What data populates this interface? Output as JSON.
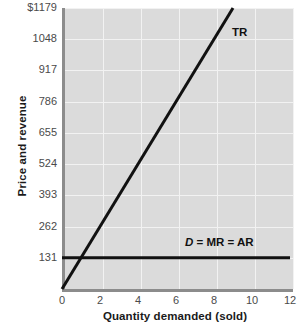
{
  "chart_data": {
    "type": "line",
    "title": "",
    "xlabel": "Quantity demanded (sold)",
    "ylabel": "Price and revenue",
    "xlim": [
      0,
      12
    ],
    "ylim": [
      0,
      1179
    ],
    "grid": true,
    "legend_position": "inline-annotation",
    "xticks": [
      "0",
      "2",
      "4",
      "6",
      "8",
      "10",
      "12"
    ],
    "xtick_values": [
      0,
      2,
      4,
      6,
      8,
      10,
      12
    ],
    "yticks": [
      "131",
      "262",
      "393",
      "524",
      "655",
      "786",
      "917",
      "1048",
      "$1179"
    ],
    "ytick_values": [
      131,
      262,
      393,
      524,
      655,
      786,
      917,
      1048,
      1179
    ],
    "series": [
      {
        "name": "TR",
        "label_html": "TR",
        "color": "#111111",
        "x": [
          0,
          9
        ],
        "values": [
          0,
          1179
        ],
        "note": "Total revenue line rising from origin through (9, 1179); slope = 131 per unit"
      },
      {
        "name": "D = MR = AR",
        "label_html": "<i>D</i> = MR = AR",
        "color": "#111111",
        "x": [
          0,
          12
        ],
        "values": [
          131,
          131
        ],
        "note": "Horizontal demand / marginal revenue / average revenue line at price 131"
      }
    ],
    "annotations": [
      {
        "text": "TR",
        "x": 9,
        "y": 1179
      },
      {
        "text": "D = MR = AR",
        "x": 7.2,
        "y": 220
      }
    ],
    "colors": {
      "plot_background": "#dbdbdb",
      "grid": "#f2f2f2",
      "axis": "#8c8c8c",
      "line": "#111111",
      "tick_text": "#4a4a4a",
      "label_text": "#1a1a1a",
      "page_background": "#ffffff"
    }
  }
}
